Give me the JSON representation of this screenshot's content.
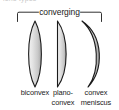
{
  "figure": {
    "title_fragment": "lens types",
    "group_label": "converging",
    "background_color": "#ffffff",
    "line_color": "#1a1a1a",
    "lens_fill_light": "#ececec",
    "lens_fill_dark": "#9e9e9e"
  },
  "bracket": {
    "name": "converging-bracket",
    "spans_label": "converging"
  },
  "lenses": [
    {
      "id": "biconvex",
      "icon": "biconvex-lens-icon",
      "caption_line1": "biconvex",
      "caption_line2": "",
      "left_surface": "convex",
      "right_surface": "convex"
    },
    {
      "id": "plano-convex",
      "icon": "plano-convex-lens-icon",
      "caption_line1": "plano-",
      "caption_line2": "convex",
      "left_surface": "plano",
      "right_surface": "convex"
    },
    {
      "id": "convex-meniscus",
      "icon": "convex-meniscus-lens-icon",
      "caption_line1": "convex",
      "caption_line2": "meniscus",
      "left_surface": "concave",
      "right_surface": "convex"
    }
  ]
}
